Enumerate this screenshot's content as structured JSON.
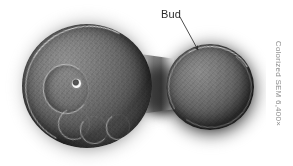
{
  "figure": {
    "kind": "scanning-electron-micrograph",
    "background_color": "#ffffff"
  },
  "annotations": {
    "bud_label": "Bud",
    "leader_line": {
      "from_x": 2,
      "from_y": 5,
      "to_x": 20,
      "to_y": 38,
      "has_arrowhead": true,
      "color": "#3a3a3a"
    }
  },
  "credit": {
    "text": "Colorized SEM 6,400×",
    "orientation": "vertical",
    "color": "#8e8e8e"
  },
  "specimen": {
    "mother_cell": {
      "name": "mother cell",
      "features": [
        "bud scar ring",
        "birth scar dot",
        "lower bud scars",
        "granular cell wall texture"
      ]
    },
    "bud": {
      "name": "bud",
      "features": [
        "smooth granular surface",
        "bright specular rim"
      ]
    },
    "neck": {
      "name": "neck / isthmus"
    }
  },
  "colors": {
    "cell_mid": "#686868",
    "cell_shadow": "#141414",
    "rim_highlight": "#f2f2f2",
    "halo": "#0a0a0a",
    "label_text": "#2b2b2b"
  }
}
